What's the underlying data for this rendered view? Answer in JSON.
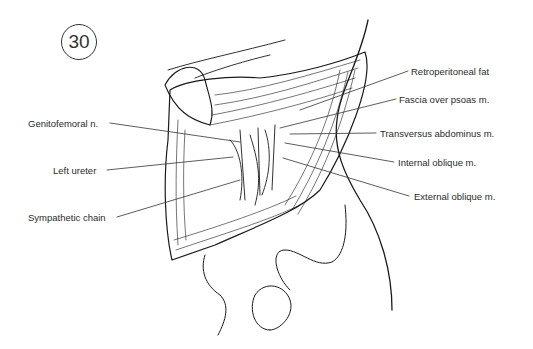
{
  "figure": {
    "number": "30",
    "labels": {
      "retroperitoneal_fat": "Retroperitoneal fat",
      "fascia_over_psoas": "Fascia over psoas m.",
      "transversus_abdominus": "Transversus abdominus m.",
      "internal_oblique": "Internal oblique m.",
      "external_oblique": "External oblique m.",
      "genitofemoral_nerve": "Genitofemoral n.",
      "left_ureter": "Left ureter",
      "sympathetic_chain": "Sympathetic chain"
    }
  }
}
